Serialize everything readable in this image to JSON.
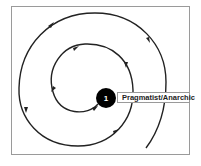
{
  "diagram": {
    "node": {
      "number": "1",
      "label": "Pragmatist/Anarchic"
    },
    "colors": {
      "line": "#222222",
      "node_fill": "#000000",
      "node_text": "#ffffff",
      "frame": "#9a9a9a"
    }
  }
}
